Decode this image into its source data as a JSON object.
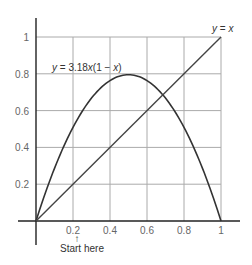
{
  "chart_data": {
    "type": "line",
    "title": "",
    "xlabel": "",
    "ylabel": "",
    "xlim": [
      0,
      1
    ],
    "ylim": [
      0,
      1
    ],
    "grid": true,
    "x_ticks": [
      "0.2",
      "0.4",
      "0.6",
      "0.8",
      "1"
    ],
    "y_ticks": [
      "0.2",
      "0.4",
      "0.6",
      "0.8",
      "1"
    ],
    "series": [
      {
        "name": "y = 3.18x(1 − x)",
        "function": "3.18*x*(1-x)",
        "x": [
          0,
          0.1,
          0.2,
          0.3,
          0.4,
          0.5,
          0.6,
          0.7,
          0.8,
          0.9,
          1.0
        ],
        "values": [
          0,
          0.286,
          0.509,
          0.668,
          0.763,
          0.795,
          0.763,
          0.668,
          0.509,
          0.286,
          0
        ]
      },
      {
        "name": "y = x",
        "function": "x",
        "x": [
          0,
          1
        ],
        "values": [
          0,
          1
        ]
      }
    ],
    "annotations": [
      {
        "text": "y = 3.18x(1 − x)",
        "near": [
          0.3,
          0.8
        ]
      },
      {
        "text": "y = x",
        "near": [
          1,
          1.05
        ]
      },
      {
        "text": "Start here",
        "arrow_at_x": 0.25
      }
    ]
  },
  "labels": {
    "curve_label": "y = 3.18x(1 − x)",
    "curve_label_y": "y",
    "curve_label_rest": " = 3.18",
    "curve_label_x1": "x",
    "curve_label_mid": "(1 − ",
    "curve_label_x2": "x",
    "curve_label_end": ")",
    "line_label_y": "y",
    "line_label_eq": " = ",
    "line_label_x": "x",
    "start_here": "Start here",
    "arrow": "↑"
  },
  "colors": {
    "grid": "#aaaaaa",
    "axis": "#222222",
    "curve": "#333333",
    "line": "#444444"
  }
}
